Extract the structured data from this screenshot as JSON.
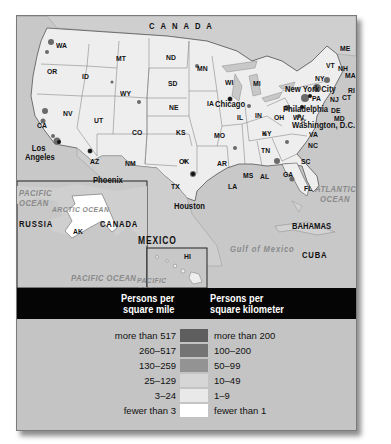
{
  "map": {
    "countries": {
      "canada_top": "CANADA",
      "canada_ak": "CANADA",
      "mexico": "MEXICO",
      "russia": "RUSSIA",
      "bahamas": "BAHAMAS",
      "cuba": "CUBA"
    },
    "oceans": {
      "pacific_line1": "PACIFIC",
      "pacific_line2": "OCEAN",
      "atlantic_line1": "ATLANTIC",
      "atlantic_line2": "OCEAN",
      "gulf": "Gulf of Mexico",
      "arctic": "ARCTIC OCEAN",
      "pacific_ak": "PACIFIC OCEAN",
      "pacific_hi_line1": "PACIFIC",
      "pacific_hi_line2": "OCEAN"
    },
    "states": [
      "WA",
      "OR",
      "CA",
      "ID",
      "NV",
      "MT",
      "WY",
      "UT",
      "AZ",
      "CO",
      "NM",
      "ND",
      "SD",
      "NE",
      "KS",
      "OK",
      "TX",
      "MN",
      "IA",
      "MO",
      "AR",
      "LA",
      "WI",
      "IL",
      "MS",
      "MI",
      "IN",
      "KY",
      "TN",
      "AL",
      "OH",
      "WV",
      "GA",
      "SC",
      "NC",
      "VA",
      "PA",
      "NY",
      "ME",
      "VT",
      "NH",
      "MA",
      "RI",
      "CT",
      "NJ",
      "DE",
      "MD",
      "FL",
      "AK",
      "HI"
    ],
    "cities": {
      "los_angeles_line1": "Los",
      "los_angeles_line2": "Angeles",
      "phoenix": "Phoenix",
      "houston": "Houston",
      "chicago": "Chicago",
      "new_york": "New York City",
      "philadelphia": "Philadelphia",
      "washington": "Washington, D.C."
    }
  },
  "legend": {
    "header_mile_line1": "Persons per",
    "header_mile_line2": "square mile",
    "header_km_line1": "Persons per",
    "header_km_line2": "square kilometer",
    "rows": [
      {
        "mile": "more than 517",
        "km": "more than 200",
        "color": "#5e5e5e"
      },
      {
        "mile": "260–517",
        "km": "100–200",
        "color": "#747474"
      },
      {
        "mile": "130–259",
        "km": "50–99",
        "color": "#939393"
      },
      {
        "mile": "25–129",
        "km": "10–49",
        "color": "#d6d6d6"
      },
      {
        "mile": "3–24",
        "km": "1–9",
        "color": "#e9e9e9"
      },
      {
        "mile": "fewer than 3",
        "km": "fewer than 1",
        "color": "#ffffff"
      }
    ]
  }
}
